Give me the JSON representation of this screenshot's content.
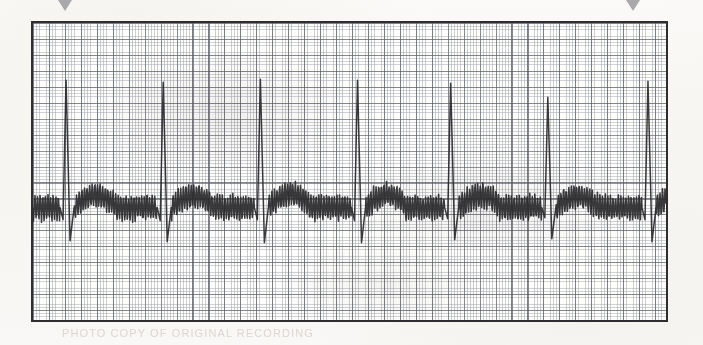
{
  "page": {
    "background_color": "#f8f7f5",
    "width": 703,
    "height": 345
  },
  "strip": {
    "frame": {
      "x": 31,
      "y": 21,
      "width": 637,
      "height": 301,
      "border_color": "#2e2e30",
      "border_width": 2.5,
      "paper_color": "#fdfdfc"
    },
    "grid": {
      "fine_spacing_px": 3.19,
      "major_spacing_px": 15.95,
      "cells_per_major": 5,
      "fine_color": "#969aa0",
      "major_color": "#5c5e66"
    },
    "trace": {
      "color": "#2b2b2d",
      "stroke_width": 1.5,
      "artifact": "high-frequency baseline tremor"
    },
    "markers": [
      {
        "name": "beat-marker-1",
        "x": 65,
        "color": "#a9a9ac",
        "shape": "triangle-down"
      },
      {
        "name": "beat-marker-2",
        "x": 633,
        "color": "#a9a9ac",
        "shape": "triangle-down"
      }
    ],
    "caption_ghost": "PHOTO COPY OF ORIGINAL RECORDING"
  },
  "chart_data": {
    "type": "line",
    "xlabel": "Time",
    "ylabel": "Amplitude",
    "grid": true,
    "legend": "none",
    "xlim": [
      0,
      637
    ],
    "ylim": [
      0,
      301
    ],
    "baseline_y": 184,
    "r_peak_y": 57,
    "s_trough_y": 217,
    "beat_count": 7,
    "rr_interval_px": 96,
    "tremor_amplitude_px": 12,
    "tremor_period_px": 2.6,
    "beats": [
      {
        "index": 1,
        "r_peak_x": 33,
        "r_peak_y": 57,
        "s_trough_y": 217,
        "q_dip_y": 196,
        "t_wave_peak_y": 170,
        "t_wave_trough_y": 215
      },
      {
        "index": 2,
        "r_peak_x": 130,
        "r_peak_y": 59,
        "s_trough_y": 218,
        "q_dip_y": 197,
        "t_wave_peak_y": 171,
        "t_wave_trough_y": 216
      },
      {
        "index": 3,
        "r_peak_x": 227,
        "r_peak_y": 56,
        "s_trough_y": 219,
        "q_dip_y": 196,
        "t_wave_peak_y": 169,
        "t_wave_trough_y": 217
      },
      {
        "index": 4,
        "r_peak_x": 324,
        "r_peak_y": 57,
        "s_trough_y": 219,
        "q_dip_y": 197,
        "t_wave_peak_y": 170,
        "t_wave_trough_y": 216
      },
      {
        "index": 5,
        "r_peak_x": 417,
        "r_peak_y": 60,
        "s_trough_y": 216,
        "q_dip_y": 195,
        "t_wave_peak_y": 171,
        "t_wave_trough_y": 214
      },
      {
        "index": 6,
        "r_peak_x": 514,
        "r_peak_y": 74,
        "s_trough_y": 215,
        "q_dip_y": 194,
        "t_wave_peak_y": 172,
        "t_wave_trough_y": 213
      },
      {
        "index": 7,
        "r_peak_x": 614,
        "r_peak_y": 58,
        "s_trough_y": 218,
        "q_dip_y": 196,
        "t_wave_peak_y": 170,
        "t_wave_trough_y": 215
      }
    ]
  }
}
